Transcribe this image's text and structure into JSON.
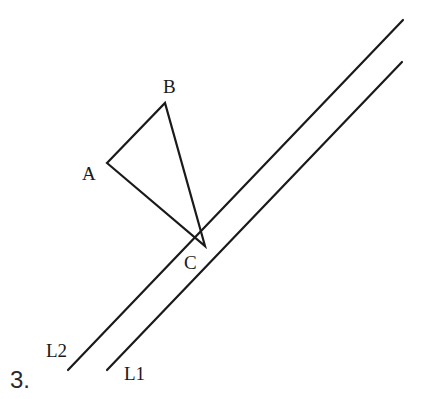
{
  "problem_number": "3.",
  "colors": {
    "stroke": "#1a1a1a",
    "background": "#ffffff"
  },
  "lines": [
    {
      "name": "L2",
      "label": "L2",
      "x1": 68,
      "y1": 370,
      "x2": 403,
      "y2": 20,
      "label_x": 46,
      "label_y": 357
    },
    {
      "name": "L1",
      "label": "L1",
      "x1": 107,
      "y1": 370,
      "x2": 402,
      "y2": 62,
      "label_x": 124,
      "label_y": 380
    }
  ],
  "triangle": {
    "vertices": {
      "A": {
        "x": 107,
        "y": 163,
        "label": "A",
        "label_x": 82,
        "label_y": 180
      },
      "B": {
        "x": 165,
        "y": 103,
        "label": "B",
        "label_x": 163,
        "label_y": 93
      },
      "C": {
        "x": 205,
        "y": 246,
        "label": "C",
        "label_x": 184,
        "label_y": 269
      }
    }
  }
}
